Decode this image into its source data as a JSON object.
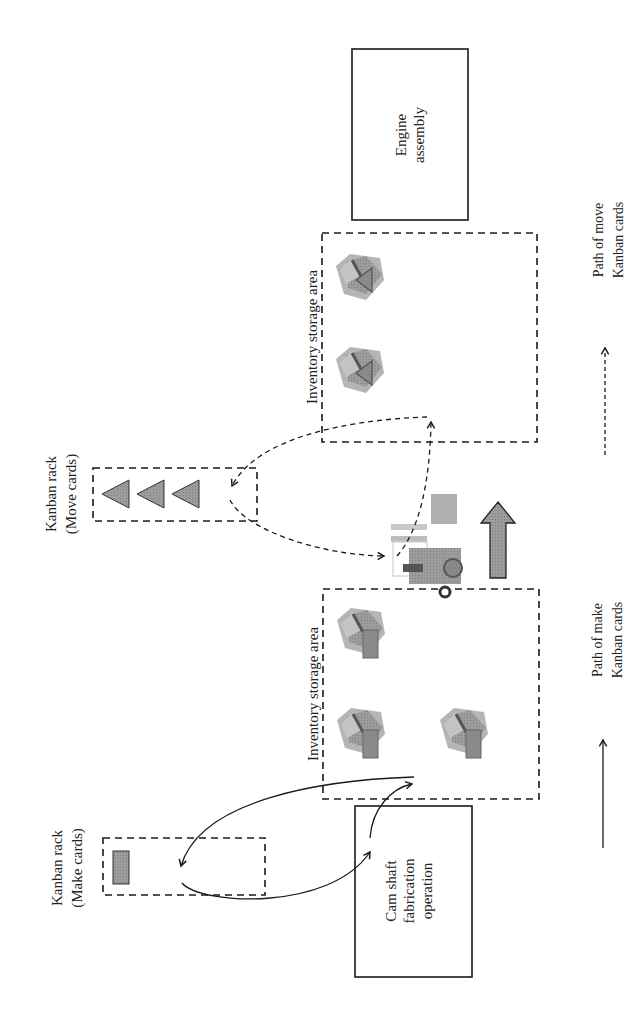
{
  "diagram": {
    "type": "kanban-flow",
    "orientation": "rotated-90-ccw",
    "nodes": {
      "engine_assembly": {
        "line1": "Engine",
        "line2": "assembly"
      },
      "cam_shaft": {
        "line1": "Cam shaft",
        "line2": "fabrication",
        "line3": "operation"
      },
      "inventory_upper": {
        "label": "Inventory storage area",
        "card_type": "move",
        "boxes": 2
      },
      "inventory_lower": {
        "label": "Inventory storage area",
        "card_type": "make",
        "boxes": 3
      },
      "kanban_move": {
        "line1": "Kanban rack",
        "line2": "(Move cards)",
        "cards": 3
      },
      "kanban_make": {
        "line1": "Kanban rack",
        "line2": "(Make cards)",
        "cards": 1
      },
      "forklift": {
        "label": "Forklift transport"
      },
      "material_flow_arrow": {
        "direction": "toward engine assembly"
      }
    },
    "legend": {
      "make": {
        "line1": "Path of make",
        "line2": "Kanban cards",
        "style": "solid"
      },
      "move": {
        "line1": "Path of move",
        "line2": "Kanban cards",
        "style": "dashed"
      }
    },
    "colors": {
      "stroke": "#1a1a1a",
      "card_fill": "#8a8a8a",
      "box_fill": "#9a9a9a",
      "arrow_fill": "#8c8c8c"
    }
  }
}
